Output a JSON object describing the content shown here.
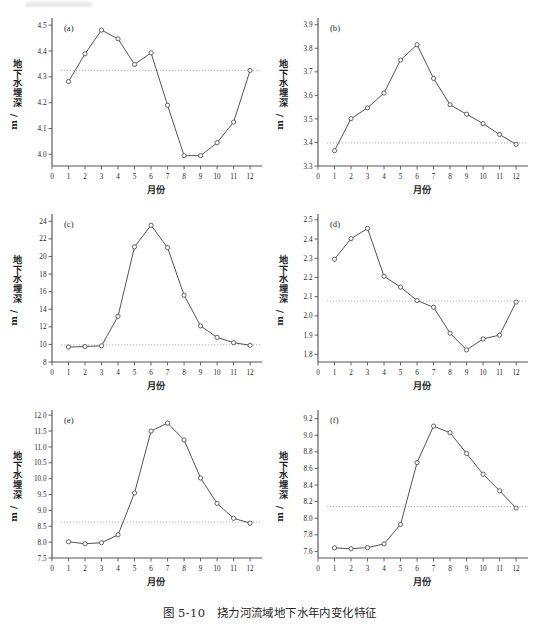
{
  "figure": {
    "caption": "图 5-10　挠力河流域地下水年内变化特征",
    "panel_count": 6,
    "width": 539,
    "height": 631,
    "background_color": "#ffffff",
    "line_color": "#4a4a4a",
    "marker_fill": "#ffffff",
    "reference_line_color": "#9a9a9a",
    "axis_color": "#555555"
  },
  "chart_data": [
    {
      "type": "line",
      "panel": "(a)",
      "title": "",
      "xlabel": "月份",
      "ylabel": "地下水埋深/m",
      "x": [
        1,
        2,
        3,
        4,
        5,
        6,
        7,
        8,
        9,
        10,
        11,
        12
      ],
      "xticks": [
        0,
        1,
        2,
        3,
        4,
        5,
        6,
        7,
        8,
        9,
        10,
        11,
        12
      ],
      "yticks": [
        4.0,
        4.1,
        4.2,
        4.3,
        4.4,
        4.5
      ],
      "xlim": [
        0,
        12.6
      ],
      "ylim": [
        3.955,
        4.52
      ],
      "values": [
        4.282,
        4.389,
        4.481,
        4.447,
        4.348,
        4.393,
        4.19,
        3.995,
        3.995,
        4.045,
        4.125,
        4.325
      ],
      "reference_value": 4.325,
      "grid": false,
      "legend": "none",
      "marker": "open-circle"
    },
    {
      "type": "line",
      "panel": "(b)",
      "title": "",
      "xlabel": "月份",
      "ylabel": "地下水埋深/m",
      "x": [
        1,
        2,
        3,
        4,
        5,
        6,
        7,
        8,
        9,
        10,
        11,
        12
      ],
      "xticks": [
        0,
        1,
        2,
        3,
        4,
        5,
        6,
        7,
        8,
        9,
        10,
        11,
        12
      ],
      "yticks": [
        3.3,
        3.4,
        3.5,
        3.6,
        3.7,
        3.8,
        3.9
      ],
      "xlim": [
        0,
        12.6
      ],
      "ylim": [
        3.3,
        3.92
      ],
      "values": [
        3.365,
        3.501,
        3.547,
        3.61,
        3.75,
        3.815,
        3.672,
        3.56,
        3.52,
        3.48,
        3.434,
        3.392
      ],
      "reference_value": 3.398,
      "grid": false,
      "legend": "none",
      "marker": "open-circle"
    },
    {
      "type": "line",
      "panel": "(c)",
      "title": "",
      "xlabel": "月份",
      "ylabel": "地下水埋深/m",
      "x": [
        1,
        2,
        3,
        4,
        5,
        6,
        7,
        8,
        9,
        10,
        11,
        12
      ],
      "xticks": [
        0,
        1,
        2,
        3,
        4,
        5,
        6,
        7,
        8,
        9,
        10,
        11,
        12
      ],
      "yticks": [
        8,
        10,
        12,
        14,
        16,
        18,
        20,
        22,
        24
      ],
      "xlim": [
        0,
        12.6
      ],
      "ylim": [
        8,
        24.6
      ],
      "values": [
        9.7,
        9.76,
        9.84,
        13.2,
        21.1,
        23.55,
        21.0,
        15.6,
        12.1,
        10.8,
        10.2,
        9.9
      ],
      "reference_value": 9.95,
      "grid": false,
      "legend": "none",
      "marker": "open-circle"
    },
    {
      "type": "line",
      "panel": "(d)",
      "title": "",
      "xlabel": "月份",
      "ylabel": "地下水埋深/m",
      "x": [
        1,
        2,
        3,
        4,
        5,
        6,
        7,
        8,
        9,
        10,
        11,
        12
      ],
      "xticks": [
        0,
        1,
        2,
        3,
        4,
        5,
        6,
        7,
        8,
        9,
        10,
        11,
        12
      ],
      "yticks": [
        1.8,
        1.9,
        2.0,
        2.1,
        2.2,
        2.3,
        2.4,
        2.5
      ],
      "xlim": [
        0,
        12.6
      ],
      "ylim": [
        1.76,
        2.52
      ],
      "values": [
        2.295,
        2.402,
        2.455,
        2.206,
        2.15,
        2.08,
        2.045,
        1.91,
        1.823,
        1.88,
        1.9,
        2.072
      ],
      "reference_value": 2.077,
      "grid": false,
      "legend": "none",
      "marker": "open-circle"
    },
    {
      "type": "line",
      "panel": "(e)",
      "title": "",
      "xlabel": "月份",
      "ylabel": "地下水埋深/m",
      "x": [
        1,
        2,
        3,
        4,
        5,
        6,
        7,
        8,
        9,
        10,
        11,
        12
      ],
      "xticks": [
        0,
        1,
        2,
        3,
        4,
        5,
        6,
        7,
        8,
        9,
        10,
        11,
        12
      ],
      "yticks": [
        7.5,
        8.0,
        8.5,
        9.0,
        9.5,
        10.0,
        10.5,
        11.0,
        11.5,
        12.0
      ],
      "xlim": [
        0,
        12.6
      ],
      "ylim": [
        7.5,
        12.1
      ],
      "values": [
        8.01,
        7.95,
        7.98,
        8.23,
        9.55,
        11.5,
        11.75,
        11.22,
        10.02,
        9.22,
        8.75,
        8.6
      ],
      "reference_value": 8.63,
      "grid": false,
      "legend": "none",
      "marker": "open-circle"
    },
    {
      "type": "line",
      "panel": "(f)",
      "title": "",
      "xlabel": "月份",
      "ylabel": "地下水埋深/m",
      "x": [
        1,
        2,
        3,
        4,
        5,
        6,
        7,
        8,
        9,
        10,
        11,
        12
      ],
      "xticks": [
        0,
        1,
        2,
        3,
        4,
        5,
        6,
        7,
        8,
        9,
        10,
        11,
        12
      ],
      "yticks": [
        7.6,
        7.8,
        8.0,
        8.2,
        8.4,
        8.6,
        8.8,
        9.0,
        9.2
      ],
      "xlim": [
        0,
        12.6
      ],
      "ylim": [
        7.52,
        9.28
      ],
      "values": [
        7.642,
        7.632,
        7.645,
        7.69,
        7.925,
        8.67,
        9.11,
        9.03,
        8.78,
        8.53,
        8.33,
        8.122
      ],
      "reference_value": 8.14,
      "grid": false,
      "legend": "none",
      "marker": "open-circle"
    }
  ]
}
